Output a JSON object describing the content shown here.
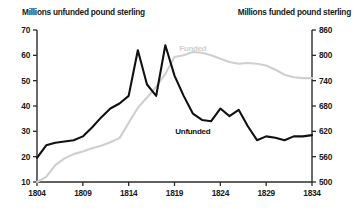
{
  "chart_data": {
    "type": "line",
    "title": "",
    "title_left": "Millions unfunded pound sterling",
    "title_right": "Millions funded pound sterling",
    "xlabel": "",
    "ylabel": "Millions unfunded pound sterling",
    "y2label": "Millions funded pound sterling",
    "xlim": [
      1804,
      1834
    ],
    "ylim": [
      10,
      70
    ],
    "y2lim": [
      500,
      860
    ],
    "xticks": [
      1804,
      1809,
      1814,
      1819,
      1824,
      1829,
      1834
    ],
    "yticks": [
      10,
      20,
      30,
      40,
      50,
      60,
      70
    ],
    "y2ticks": [
      500,
      560,
      620,
      680,
      740,
      800,
      860
    ],
    "grid": false,
    "legend": "inline-annotations",
    "series": [
      {
        "name": "Unfunded",
        "axis": "left",
        "color": "#111111",
        "label_x": 1821,
        "label_y": 30,
        "x": [
          1804,
          1805,
          1806,
          1807,
          1808,
          1809,
          1810,
          1811,
          1812,
          1813,
          1814,
          1815,
          1816,
          1817,
          1818,
          1819,
          1820,
          1821,
          1822,
          1823,
          1824,
          1825,
          1826,
          1827,
          1828,
          1829,
          1830,
          1831,
          1832,
          1833,
          1834
        ],
        "values": [
          19.5,
          24.5,
          25.5,
          26.0,
          26.5,
          28.0,
          31.5,
          35.5,
          39.0,
          41.0,
          44.0,
          62.0,
          48.5,
          44.0,
          64.0,
          52.0,
          44.0,
          37.0,
          34.5,
          34.0,
          39.0,
          36.0,
          38.5,
          32.0,
          26.5,
          28.0,
          27.5,
          26.5,
          28.0,
          28.0,
          28.5
        ]
      },
      {
        "name": "Funded",
        "axis": "right",
        "color": "#cfcfcf",
        "label_x": 1821,
        "label_y": 800,
        "x": [
          1804,
          1805,
          1806,
          1807,
          1808,
          1809,
          1810,
          1811,
          1812,
          1813,
          1814,
          1815,
          1816,
          1817,
          1818,
          1819,
          1820,
          1821,
          1822,
          1823,
          1824,
          1825,
          1826,
          1827,
          1828,
          1829,
          1830,
          1831,
          1832,
          1833,
          1834
        ],
        "values": [
          500,
          512,
          540,
          556,
          566,
          572,
          580,
          586,
          594,
          604,
          640,
          676,
          700,
          726,
          756,
          796,
          800,
          808,
          806,
          800,
          792,
          784,
          780,
          782,
          780,
          776,
          766,
          754,
          748,
          746,
          746
        ]
      }
    ]
  },
  "annotations": {
    "unfunded_label": "Unfunded",
    "funded_label": "Funded"
  }
}
